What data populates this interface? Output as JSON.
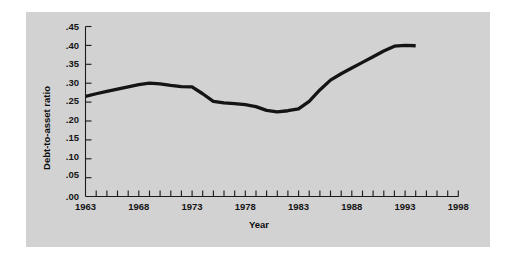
{
  "figure": {
    "background_color": "#ffffff",
    "panel_color": "#d2d2d2",
    "line_color": "#141414"
  },
  "axes": {
    "y_title": "Debt-to-asset ratio",
    "x_title": "Year",
    "y_ticks": [
      ".00",
      ".05",
      ".10",
      ".15",
      ".20",
      ".25",
      ".30",
      ".35",
      ".40",
      ".45"
    ],
    "x_ticks": [
      "1963",
      "1968",
      "1973",
      "1978",
      "1983",
      "1988",
      "1993",
      "1998"
    ]
  },
  "chart_data": {
    "type": "line",
    "title": "",
    "xlabel": "Year",
    "ylabel": "Debt-to-asset ratio",
    "xlim": [
      1963,
      1998
    ],
    "ylim": [
      0.0,
      0.45
    ],
    "grid": false,
    "legend": "none",
    "x_tick_labels": [
      "1963",
      "1968",
      "1973",
      "1978",
      "1983",
      "1988",
      "1993",
      "1998"
    ],
    "x_major_tick_values": [
      1963,
      1968,
      1973,
      1978,
      1983,
      1988,
      1993,
      1998
    ],
    "x_minor_tick_interval": 1,
    "y_tick_labels": [
      ".00",
      ".05",
      ".10",
      ".15",
      ".20",
      ".25",
      ".30",
      ".35",
      ".40",
      ".45"
    ],
    "y_tick_values": [
      0.0,
      0.05,
      0.1,
      0.15,
      0.2,
      0.25,
      0.3,
      0.35,
      0.4,
      0.45
    ],
    "series": [
      {
        "name": "Debt-to-asset ratio",
        "x": [
          1963,
          1964,
          1965,
          1966,
          1967,
          1968,
          1969,
          1970,
          1971,
          1972,
          1973,
          1974,
          1975,
          1976,
          1977,
          1978,
          1979,
          1980,
          1981,
          1982,
          1983,
          1984,
          1985,
          1986,
          1987,
          1988,
          1989,
          1990,
          1991,
          1992,
          1993,
          1994
        ],
        "values": [
          0.265,
          0.272,
          0.278,
          0.284,
          0.29,
          0.296,
          0.3,
          0.298,
          0.294,
          0.291,
          0.29,
          0.272,
          0.252,
          0.248,
          0.246,
          0.243,
          0.238,
          0.228,
          0.224,
          0.227,
          0.232,
          0.252,
          0.282,
          0.308,
          0.325,
          0.34,
          0.355,
          0.37,
          0.385,
          0.398,
          0.4,
          0.399
        ]
      }
    ]
  }
}
